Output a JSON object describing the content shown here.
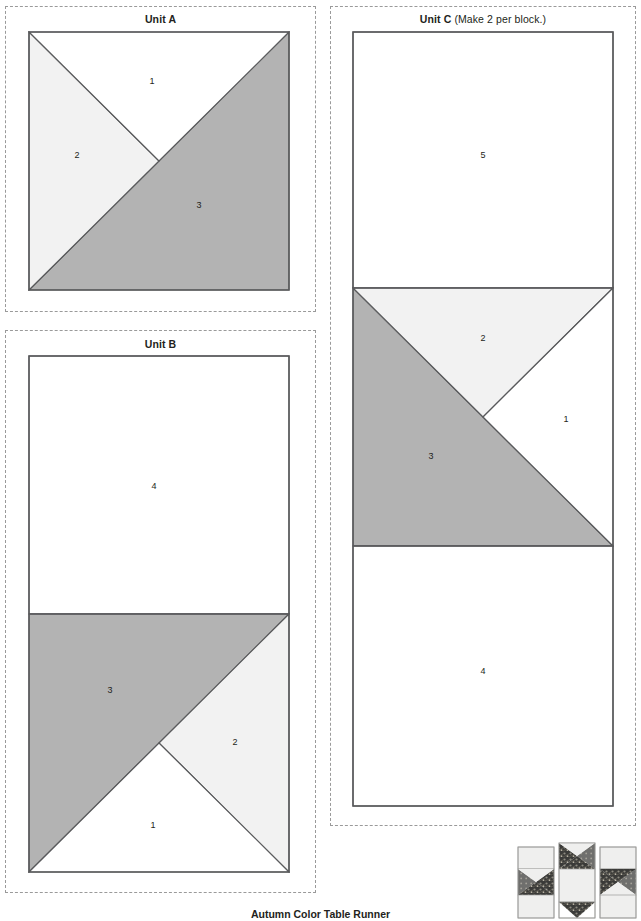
{
  "document": {
    "footer_title": "Autumn Color Table Runner"
  },
  "colors": {
    "fabric_white": "#ffffff",
    "fabric_light": "#f2f2f2",
    "fabric_medium": "#b3b3b3",
    "outline": "#58595b",
    "cut_line": "#9a9a9a",
    "text": "#231f20"
  },
  "panels": [
    {
      "id": "unit-a",
      "title_strong": "Unit A",
      "title_normal": "",
      "pieces": [
        {
          "label": "1",
          "fabric": "fabric_white",
          "x": 152,
          "y": 82
        },
        {
          "label": "2",
          "fabric": "fabric_light",
          "x": 77,
          "y": 156
        },
        {
          "label": "3",
          "fabric": "fabric_medium",
          "x": 199,
          "y": 206
        }
      ]
    },
    {
      "id": "unit-b",
      "title_strong": "Unit B",
      "title_normal": "",
      "pieces": [
        {
          "label": "4",
          "fabric": "fabric_white",
          "x": 154,
          "y": 487
        },
        {
          "label": "3",
          "fabric": "fabric_medium",
          "x": 110,
          "y": 691
        },
        {
          "label": "2",
          "fabric": "fabric_light",
          "x": 235,
          "y": 743
        },
        {
          "label": "1",
          "fabric": "fabric_white",
          "x": 153,
          "y": 826
        }
      ]
    },
    {
      "id": "unit-c",
      "title_strong": "Unit C",
      "title_normal": "(Make 2 per block.)",
      "pieces": [
        {
          "label": "5",
          "fabric": "fabric_white",
          "x": 483,
          "y": 156
        },
        {
          "label": "2",
          "fabric": "fabric_light",
          "x": 483,
          "y": 339
        },
        {
          "label": "1",
          "fabric": "fabric_white",
          "x": 566,
          "y": 420
        },
        {
          "label": "3",
          "fabric": "fabric_medium",
          "x": 431,
          "y": 457
        },
        {
          "label": "4",
          "fabric": "fabric_white",
          "x": 483,
          "y": 672
        }
      ]
    }
  ],
  "thumbnail": {
    "name": "block-preview",
    "description": "quilt block preview"
  }
}
